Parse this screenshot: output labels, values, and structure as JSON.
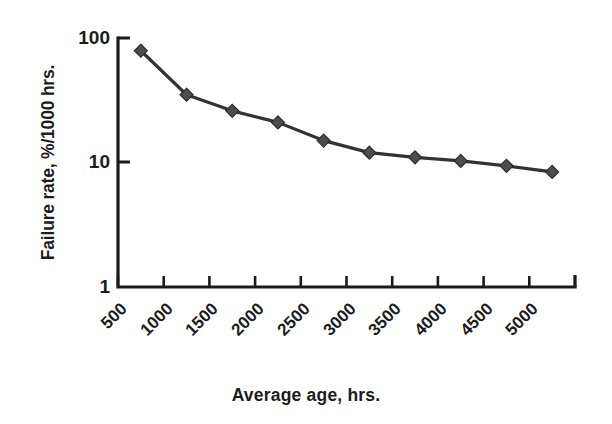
{
  "chart_data": {
    "type": "line",
    "title": "",
    "xlabel": "Average age, hrs.",
    "ylabel": "Failure rate, %/1000 hrs.",
    "yscale": "log",
    "ylim": [
      1,
      100
    ],
    "xlim": [
      500,
      5000
    ],
    "grid": false,
    "legend": null,
    "y_ticks": [
      "100",
      "10",
      "1"
    ],
    "y_tick_values": [
      100,
      10,
      1
    ],
    "x_ticks": [
      "500",
      "1000",
      "1500",
      "2000",
      "2500",
      "3000",
      "3500",
      "4000",
      "4500",
      "5000"
    ],
    "x_tick_values": [
      500,
      1000,
      1500,
      2000,
      2500,
      3000,
      3500,
      4000,
      4500,
      5000
    ],
    "x": [
      750,
      1250,
      1750,
      2250,
      2750,
      3250,
      3750,
      4250,
      4750,
      5250
    ],
    "values": [
      79,
      35,
      26,
      21,
      15,
      12,
      11,
      10.3,
      9.4,
      8.4
    ],
    "marker": "diamond",
    "marker_color": "#4d4d4d",
    "line_color": "#333333",
    "axis_color": "#1a1a1a",
    "background": "#ffffff"
  },
  "axes": {
    "y_title": "Failure rate, %/1000 hrs.",
    "x_title": "Average age, hrs."
  }
}
